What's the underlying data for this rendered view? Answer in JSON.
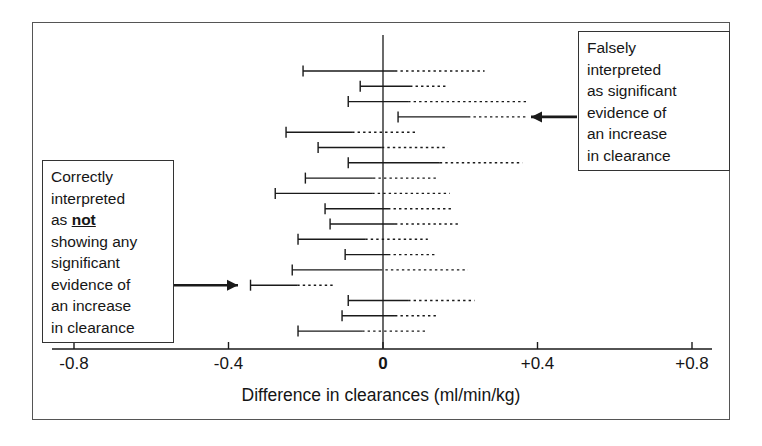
{
  "figure": {
    "kind": "forest-plot",
    "background_color": "#ffffff",
    "frame_color": "#555555",
    "line_color": "#1a1a1a"
  },
  "axis": {
    "title": "Difference in clearances (ml/min/kg)",
    "ticks": [
      {
        "value": -0.8,
        "label": "-0.8",
        "bold": false
      },
      {
        "value": -0.4,
        "label": "-0.4",
        "bold": false
      },
      {
        "value": 0.0,
        "label": "0",
        "bold": true
      },
      {
        "value": 0.4,
        "label": "+0.4",
        "bold": false
      },
      {
        "value": 0.8,
        "label": "+0.8",
        "bold": false
      }
    ],
    "zero_reference_label": "0"
  },
  "callouts": {
    "left": {
      "name": "correctly-interpreted-callout",
      "lines": [
        "Correctly",
        "interpreted",
        "as not",
        "showing any",
        "significant",
        "evidence of",
        "an increase",
        "in clearance"
      ],
      "emphasis_word": "not",
      "arrow_direction": "right",
      "points_to_row_index": 14
    },
    "right": {
      "name": "falsely-interpreted-callout",
      "lines": [
        "Falsely",
        "interpreted",
        "as significant",
        "evidence of",
        "an increase",
        "in clearance"
      ],
      "arrow_direction": "left",
      "points_to_row_index": 3
    }
  },
  "chart_data": {
    "type": "bar",
    "subtype": "forest-plot-confidence-intervals",
    "title": "",
    "xlabel": "Difference in clearances (ml/min/kg)",
    "ylabel": "",
    "xlim": [
      -0.95,
      0.9
    ],
    "ylim": [
      0,
      18
    ],
    "grid": false,
    "legend": null,
    "xticks": [
      -0.8,
      -0.4,
      0,
      0.4,
      0.8
    ],
    "xticklabels": [
      "-0.8",
      "-0.4",
      "0",
      "+0.4",
      "+0.8"
    ],
    "zero_line": 0,
    "series": [
      {
        "name": "confidence-interval",
        "field": "lower",
        "values": [
          -0.207,
          -0.059,
          -0.09,
          0.039,
          -0.251,
          -0.168,
          -0.09,
          -0.201,
          -0.279,
          -0.15,
          -0.137,
          -0.22,
          -0.098,
          -0.235,
          -0.343,
          -0.09,
          -0.106,
          -0.22
        ]
      },
      {
        "name": "confidence-interval",
        "field": "solid_end",
        "values": [
          0.031,
          0.07,
          0.065,
          0.22,
          -0.08,
          -0.003,
          0.147,
          -0.026,
          -0.028,
          0.013,
          0.031,
          -0.046,
          0.013,
          -0.008,
          -0.222,
          0.065,
          0.031,
          -0.054
        ]
      },
      {
        "name": "confidence-interval",
        "field": "upper",
        "values": [
          0.263,
          0.168,
          0.372,
          0.372,
          0.09,
          0.168,
          0.361,
          0.139,
          0.173,
          0.178,
          0.194,
          0.116,
          0.134,
          0.22,
          -0.124,
          0.237,
          0.142,
          0.116
        ]
      }
    ],
    "rows": [
      {
        "index": 0,
        "lower": -0.207,
        "solid_end": 0.031,
        "upper": 0.263
      },
      {
        "index": 1,
        "lower": -0.059,
        "solid_end": 0.07,
        "upper": 0.168
      },
      {
        "index": 2,
        "lower": -0.09,
        "solid_end": 0.065,
        "upper": 0.372
      },
      {
        "index": 3,
        "lower": 0.039,
        "solid_end": 0.22,
        "upper": 0.372
      },
      {
        "index": 4,
        "lower": -0.251,
        "solid_end": -0.08,
        "upper": 0.09
      },
      {
        "index": 5,
        "lower": -0.168,
        "solid_end": -0.003,
        "upper": 0.168
      },
      {
        "index": 6,
        "lower": -0.09,
        "solid_end": 0.147,
        "upper": 0.361
      },
      {
        "index": 7,
        "lower": -0.201,
        "solid_end": -0.026,
        "upper": 0.139
      },
      {
        "index": 8,
        "lower": -0.279,
        "solid_end": -0.028,
        "upper": 0.173
      },
      {
        "index": 9,
        "lower": -0.15,
        "solid_end": 0.013,
        "upper": 0.178
      },
      {
        "index": 10,
        "lower": -0.137,
        "solid_end": 0.031,
        "upper": 0.194
      },
      {
        "index": 11,
        "lower": -0.22,
        "solid_end": -0.046,
        "upper": 0.116
      },
      {
        "index": 12,
        "lower": -0.098,
        "solid_end": 0.013,
        "upper": 0.134
      },
      {
        "index": 13,
        "lower": -0.235,
        "solid_end": -0.008,
        "upper": 0.22
      },
      {
        "index": 14,
        "lower": -0.343,
        "solid_end": -0.222,
        "upper": -0.124
      },
      {
        "index": 15,
        "lower": -0.09,
        "solid_end": 0.065,
        "upper": 0.237
      },
      {
        "index": 16,
        "lower": -0.106,
        "solid_end": 0.031,
        "upper": 0.142
      },
      {
        "index": 17,
        "lower": -0.22,
        "solid_end": -0.054,
        "upper": 0.116
      }
    ]
  }
}
